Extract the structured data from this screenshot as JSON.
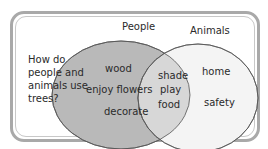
{
  "diagram": {
    "type": "venn",
    "question": "How do people and animals use trees?",
    "sets": [
      {
        "name": "People",
        "color": "#b8b8b8",
        "items": [
          "wood",
          "enjoy flowers",
          "decorate"
        ]
      },
      {
        "name": "Animals",
        "color": "#f3f3f3",
        "items": [
          "home",
          "safety"
        ]
      }
    ],
    "overlap": {
      "color": "#d6d6d6",
      "items": [
        "shade",
        "play",
        "food"
      ]
    }
  }
}
